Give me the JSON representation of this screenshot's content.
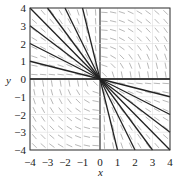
{
  "chart_data": {
    "type": "line",
    "title": "",
    "xlabel": "x",
    "ylabel": "y",
    "xlim": [
      -4,
      4
    ],
    "ylim": [
      -4,
      4
    ],
    "xticks": [
      "-4",
      "-3",
      "-2",
      "-1",
      "0",
      "1",
      "2",
      "3",
      "4"
    ],
    "yticks": [
      "-4",
      "-3",
      "-2",
      "-1",
      "0",
      "1",
      "2",
      "3",
      "4"
    ],
    "grid": true,
    "slope_field": true,
    "series": [
      {
        "name": "y = -x/4",
        "slope": -0.25
      },
      {
        "name": "y = -x/2",
        "slope": -0.5
      },
      {
        "name": "y = -3x/4",
        "slope": -0.75
      },
      {
        "name": "y = -x",
        "slope": -1
      },
      {
        "name": "y = -4x/3",
        "slope": -1.333
      },
      {
        "name": "y = -2x",
        "slope": -2
      },
      {
        "name": "y = -4x",
        "slope": -4
      },
      {
        "name": "y = 0",
        "slope": 0
      }
    ]
  },
  "axes": {
    "x_label": "x",
    "y_label": "y"
  }
}
